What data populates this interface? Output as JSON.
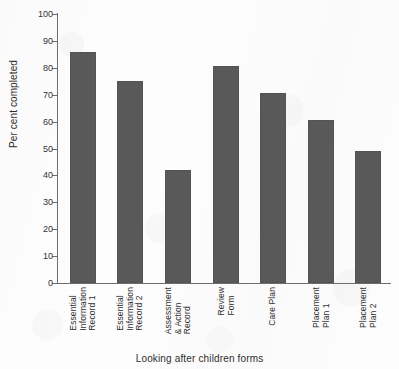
{
  "chart_data": {
    "type": "bar",
    "title": "",
    "xlabel": "Looking after children forms",
    "ylabel": "Per cent completed",
    "categories": [
      "Essential Information Record 1",
      "Essential Information Record 2",
      "Assessment & Action Record",
      "Review Form",
      "Care Plan",
      "Placement Plan 1",
      "Placement Plan 2"
    ],
    "category_lines": [
      [
        "Essential",
        "Information",
        "Record 1"
      ],
      [
        "Essential",
        "Information",
        "Record 2"
      ],
      [
        "Assessment",
        "& Action",
        "Record"
      ],
      [
        "Review",
        "Form"
      ],
      [
        "Care Plan"
      ],
      [
        "Placement",
        "Plan 1"
      ],
      [
        "Placement",
        "Plan 2"
      ]
    ],
    "values": [
      86,
      75,
      42,
      80.5,
      70.5,
      60.5,
      49
    ],
    "ylim": [
      0,
      100
    ],
    "ytick_values": [
      0,
      10,
      20,
      30,
      40,
      50,
      60,
      70,
      80,
      90,
      100
    ],
    "ytick_labels": [
      "0",
      "10",
      "20",
      "30",
      "40",
      "50",
      "60",
      "70",
      "80",
      "90",
      "100"
    ],
    "grid": false,
    "legend": null,
    "bar_color": "#595959",
    "axis_color": "#6d6d6d",
    "background_color": "#fdfdfd"
  }
}
